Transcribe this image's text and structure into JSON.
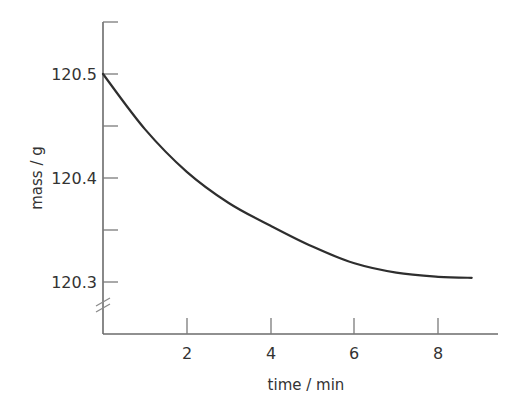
{
  "chart_data": {
    "type": "line",
    "title": "",
    "xlabel": "time / min",
    "ylabel": "mass / g",
    "xlim": [
      0,
      9.5
    ],
    "ylim": [
      120.25,
      120.55
    ],
    "x_ticks": [
      2,
      4,
      6,
      8
    ],
    "x_tick_labels": [
      "2",
      "4",
      "6",
      "8"
    ],
    "y_major_ticks": [
      120.3,
      120.4,
      120.5
    ],
    "y_tick_labels": [
      "120.3",
      "120.4",
      "120.5"
    ],
    "y_minor_ticks": [
      120.35,
      120.45,
      120.55
    ],
    "y_axis_break": true,
    "grid": false,
    "legend": null,
    "series": [
      {
        "name": "mass",
        "x": [
          0,
          1,
          2,
          3,
          4,
          5,
          6,
          7,
          8,
          8.8
        ],
        "y": [
          120.5,
          120.447,
          120.406,
          120.376,
          120.354,
          120.334,
          120.318,
          120.309,
          120.305,
          120.304
        ]
      }
    ]
  }
}
